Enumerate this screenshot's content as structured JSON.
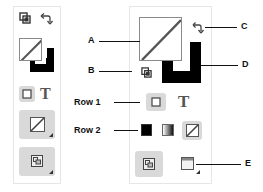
{
  "figure": {
    "labels": {
      "a": "A",
      "b": "B",
      "c": "C",
      "d": "D",
      "e": "E",
      "row1": "Row 1",
      "row2": "Row 2"
    },
    "icons": {
      "default_fill_stroke": "default-fill-stroke-icon",
      "swap_fill_stroke": "swap-fill-stroke-icon",
      "fill_box": "fill-box-none",
      "stroke_box": "stroke-box-black",
      "formatting_container": "formatting-affects-container-icon",
      "formatting_text": "formatting-affects-text-icon",
      "apply_color": "apply-color-icon",
      "apply_gradient": "apply-gradient-icon",
      "apply_none": "apply-none-icon",
      "screen_mode_normal": "screen-mode-normal-icon",
      "view_mode": "view-mode-icon"
    },
    "glyphs": {
      "text": "T"
    },
    "colors": {
      "stroke": "#000000",
      "fill": "#ffffff",
      "none_slash": "#b03030",
      "button_bg": "#d9d9d9",
      "panel_border": "#e6e6e6"
    }
  }
}
